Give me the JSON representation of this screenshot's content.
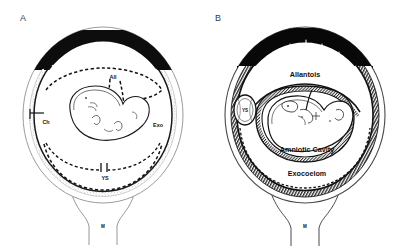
{
  "figure": {
    "type": "anatomical-diagram",
    "background_color": "#ffffff",
    "ink_color": "#101010",
    "panels": [
      {
        "id": "A",
        "letter": "A",
        "letter_pos": {
          "x": 20,
          "y": 21
        },
        "description": "Early gestation: chorion frondosum villi fill the upper pole, amnion and yolk sac shown as dashed outlines, small C-shaped embryo at center.",
        "center": {
          "cx": 103,
          "cy": 115
        },
        "outer_rx": 80,
        "outer_ry": 88,
        "labels": [
          {
            "name": "allantois-abbrev",
            "text": "All",
            "x": 113,
            "y": 79,
            "size": "sm",
            "anchor": "middle"
          },
          {
            "name": "chorion-abbrev",
            "text": "Ch",
            "x": 46,
            "y": 124,
            "size": "sm",
            "anchor": "middle"
          },
          {
            "name": "exocoelom-abbrev",
            "text": "Exo",
            "x": 158,
            "y": 127,
            "size": "sm",
            "anchor": "middle"
          },
          {
            "name": "yolk-sac-abbrev",
            "text": "YS",
            "x": 105,
            "y": 180,
            "size": "sm",
            "anchor": "middle"
          },
          {
            "name": "myometrium-abbrev",
            "text": "M",
            "x": 103,
            "y": 228,
            "size": "xs",
            "anchor": "middle"
          }
        ],
        "leader_line": {
          "name": "chorion-pointer",
          "x1": 30,
          "y1": 113,
          "x2": 44,
          "y2": 113
        }
      },
      {
        "id": "B",
        "letter": "B",
        "letter_pos": {
          "x": 215,
          "y": 21
        },
        "description": "Later gestation: solid dark placental disc at upper pole with scalloped cotyledons, thick stippled decidua encircling the sac, enlarged fetus filling the amniotic cavity, compressed yolk sac at left.",
        "center": {
          "cx": 305,
          "cy": 115
        },
        "outer_rx": 80,
        "outer_ry": 88,
        "labels": [
          {
            "name": "allantois-label",
            "text": "Allantois",
            "x": 305,
            "y": 77,
            "size": "md",
            "anchor": "middle"
          },
          {
            "name": "yolk-sac-abbrev",
            "text": "YS",
            "x": 245,
            "y": 110,
            "size": "xs",
            "anchor": "middle"
          },
          {
            "name": "amniotic-cavity-label",
            "text": "Amniotic Cavity",
            "x": 307,
            "y": 152,
            "size": "md",
            "anchor": "middle"
          },
          {
            "name": "exocoelom-label",
            "text": "Exocoelom",
            "x": 307,
            "y": 176,
            "size": "md",
            "anchor": "middle"
          },
          {
            "name": "myometrium-abbrev",
            "text": "M",
            "x": 305,
            "y": 228,
            "size": "xs",
            "anchor": "middle"
          }
        ]
      }
    ],
    "legend_keys": [
      {
        "abbrev": "All",
        "meaning": "Allantois"
      },
      {
        "abbrev": "Ch",
        "meaning": "Chorion"
      },
      {
        "abbrev": "Exo",
        "meaning": "Exocoelom"
      },
      {
        "abbrev": "YS",
        "meaning": "Yolk Sac"
      },
      {
        "abbrev": "M",
        "meaning": "Myometrium"
      }
    ]
  }
}
